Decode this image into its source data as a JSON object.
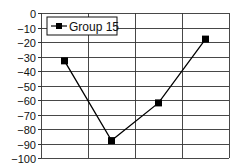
{
  "chart_data": {
    "type": "line",
    "title": "",
    "xlabel": "",
    "ylabel": "",
    "categories": [
      "1",
      "2",
      "3",
      "4"
    ],
    "x_tick_labels_visible": false,
    "series": [
      {
        "name": "Group 15",
        "values": [
          -33,
          -88,
          -62,
          -18
        ],
        "color": "#000000",
        "marker": "square"
      }
    ],
    "ylim": [
      -100,
      0
    ],
    "yticks": [
      0,
      -10,
      -20,
      -30,
      -40,
      -50,
      -60,
      -70,
      -80,
      -90,
      -100
    ],
    "ytick_labels": [
      "0",
      "−10",
      "−20",
      "−30",
      "−40",
      "−50",
      "−60",
      "−70",
      "−80",
      "−90",
      "−100"
    ],
    "grid": {
      "horizontal": true,
      "vertical": true,
      "vertical_count": 4
    },
    "legend": {
      "position": "upper-left-inside",
      "entries": [
        "Group 15"
      ]
    }
  },
  "colors": {
    "line": "#000000",
    "grid": "#333333",
    "background": "#ffffff"
  }
}
